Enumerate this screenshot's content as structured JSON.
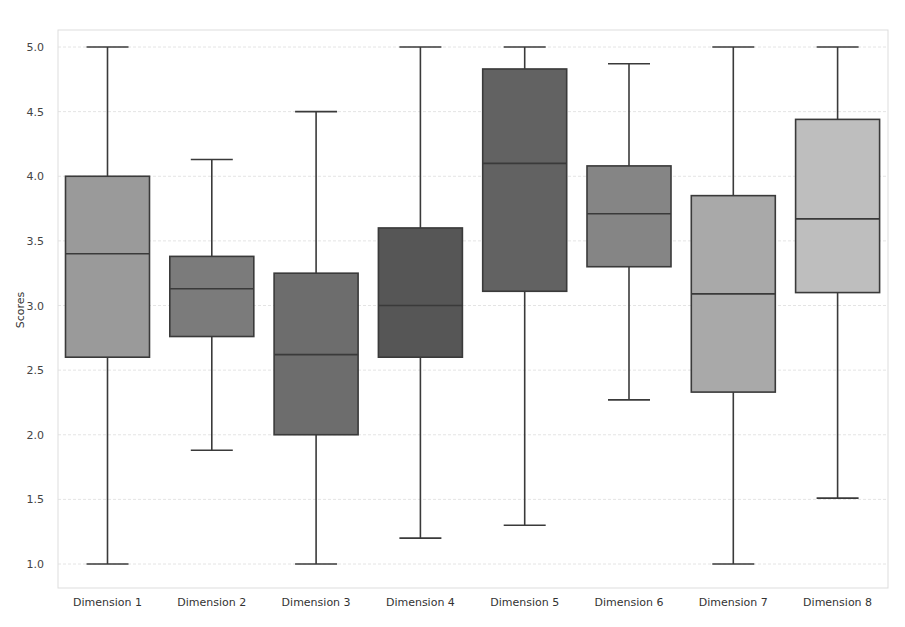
{
  "chart_data": {
    "type": "box",
    "title": "",
    "xlabel": "",
    "ylabel": "Scores",
    "ylim": [
      0.9,
      5.1
    ],
    "yticks": [
      "1.0",
      "1.5",
      "2.0",
      "2.5",
      "3.0",
      "3.5",
      "4.0",
      "4.5",
      "5.0"
    ],
    "grid": true,
    "legend": null,
    "categories": [
      "Dimension 1",
      "Dimension 2",
      "Dimension 3",
      "Dimension 4",
      "Dimension 5",
      "Dimension 6",
      "Dimension 7",
      "Dimension 8"
    ],
    "boxes": [
      {
        "name": "Dimension 1",
        "whisker_low": 1.0,
        "q1": 2.6,
        "median": 3.4,
        "q3": 4.0,
        "whisker_high": 5.0,
        "color": "#9a9a9a"
      },
      {
        "name": "Dimension 2",
        "whisker_low": 1.88,
        "q1": 2.76,
        "median": 3.13,
        "q3": 3.38,
        "whisker_high": 4.13,
        "color": "#7b7b7b"
      },
      {
        "name": "Dimension 3",
        "whisker_low": 1.0,
        "q1": 2.0,
        "median": 2.62,
        "q3": 3.25,
        "whisker_high": 4.5,
        "color": "#6d6d6d"
      },
      {
        "name": "Dimension 4",
        "whisker_low": 1.2,
        "q1": 2.6,
        "median": 3.0,
        "q3": 3.6,
        "whisker_high": 5.0,
        "color": "#565656"
      },
      {
        "name": "Dimension 5",
        "whisker_low": 1.3,
        "q1": 3.11,
        "median": 4.1,
        "q3": 4.83,
        "whisker_high": 5.0,
        "color": "#626262"
      },
      {
        "name": "Dimension 6",
        "whisker_low": 2.27,
        "q1": 3.3,
        "median": 3.71,
        "q3": 4.08,
        "whisker_high": 4.87,
        "color": "#858585"
      },
      {
        "name": "Dimension 7",
        "whisker_low": 1.0,
        "q1": 2.33,
        "median": 3.09,
        "q3": 3.85,
        "whisker_high": 5.0,
        "color": "#a9a9a9"
      },
      {
        "name": "Dimension 8",
        "whisker_low": 1.51,
        "q1": 3.1,
        "median": 3.67,
        "q3": 4.44,
        "whisker_high": 5.0,
        "color": "#bebebe"
      }
    ]
  }
}
